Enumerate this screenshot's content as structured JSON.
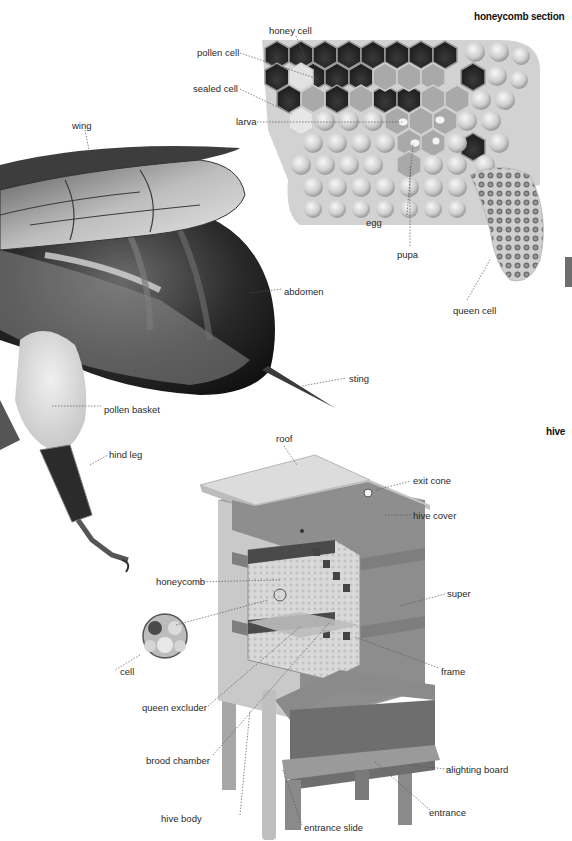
{
  "sections": {
    "honeycomb": {
      "title": "honeycomb section",
      "labels": [
        "honey cell",
        "pollen cell",
        "sealed cell",
        "larva",
        "egg",
        "pupa",
        "queen cell"
      ]
    },
    "bee": {
      "labels": [
        "wing",
        "abdomen",
        "sting",
        "pollen basket",
        "hind leg"
      ]
    },
    "hive": {
      "title": "hive",
      "labels": [
        "roof",
        "exit cone",
        "hive cover",
        "honeycomb",
        "super",
        "cell",
        "frame",
        "queen excluder",
        "brood chamber",
        "alighting board",
        "hive body",
        "entrance",
        "entrance slide"
      ]
    }
  },
  "colors": {
    "background": "#ffffff",
    "label_text": "#2a2a2a",
    "leader_line": "#555555",
    "page_tab": "#6e6e6e"
  }
}
